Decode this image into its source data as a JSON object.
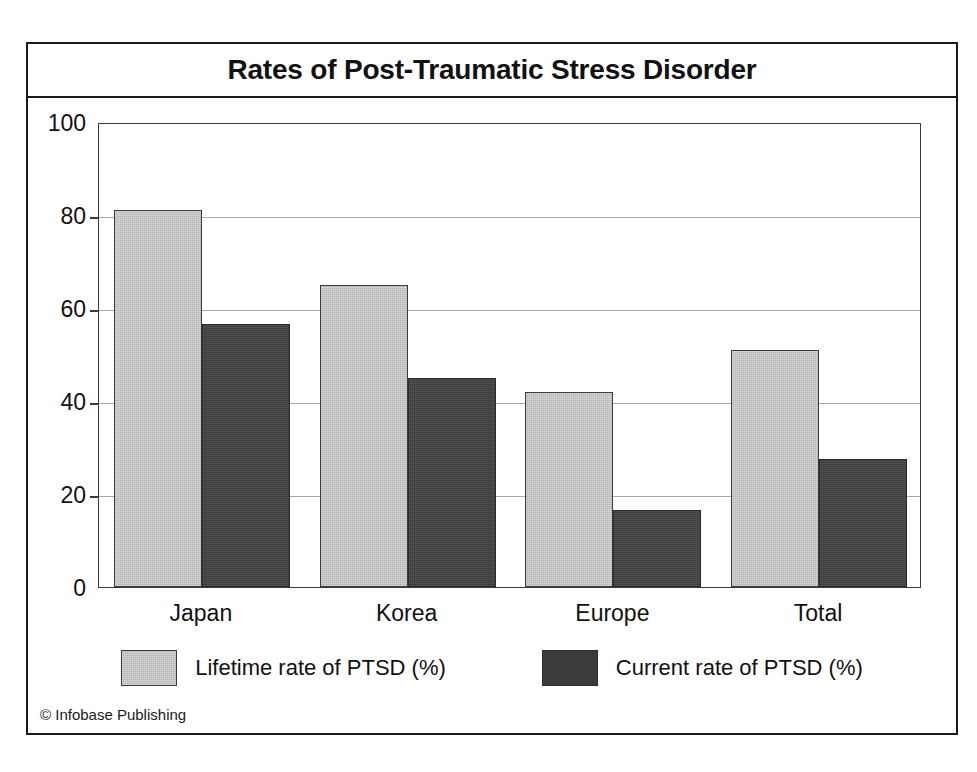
{
  "figure": {
    "title": "Rates of Post-Traumatic Stress Disorder",
    "credit": "© Infobase Publishing",
    "frame_color": "#1a1a1a",
    "background": "#ffffff"
  },
  "axis": {
    "y_ticks": [
      "0",
      "20",
      "40",
      "60",
      "80",
      "100"
    ],
    "x_categories": [
      "Japan",
      "Korea",
      "Europe",
      "Total"
    ]
  },
  "legend": {
    "items": [
      {
        "label": "Lifetime rate of PTSD (%)",
        "color": "#b4b4b4"
      },
      {
        "label": "Current rate of PTSD (%)",
        "color": "#3b3b3b"
      }
    ]
  },
  "chart_data": {
    "type": "bar",
    "title": "Rates of Post-Traumatic Stress Disorder",
    "subtitle": "",
    "xlabel": "",
    "ylabel": "",
    "categories": [
      "Japan",
      "Korea",
      "Europe",
      "Total"
    ],
    "series": [
      {
        "name": "Lifetime rate of PTSD (%)",
        "color": "#b4b4b4",
        "values": [
          81,
          65,
          42,
          51
        ]
      },
      {
        "name": "Current rate of PTSD (%)",
        "color": "#3b3b3b",
        "values": [
          56.5,
          45,
          16.5,
          27.5
        ]
      }
    ],
    "ylim": [
      0,
      100
    ],
    "ytick_interval": 20,
    "grid": true,
    "grid_axis": "y",
    "legend_position": "bottom",
    "annotations": [
      "© Infobase Publishing"
    ]
  }
}
